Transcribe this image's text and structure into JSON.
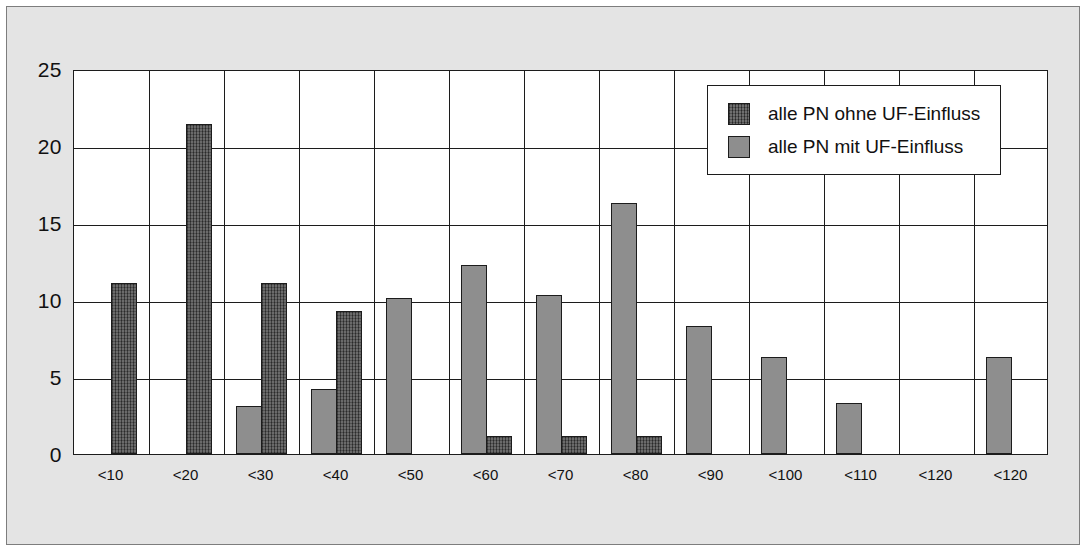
{
  "chart_data": {
    "type": "bar",
    "title": "",
    "subtitle": "",
    "xlabel": "",
    "ylabel": "",
    "ylim": [
      0,
      25
    ],
    "yticks": [
      0,
      5,
      10,
      15,
      20,
      25
    ],
    "ytick_labels": [
      "0",
      "5",
      "10",
      "15",
      "20",
      "25"
    ],
    "grid": "both",
    "legend_position": "top-right",
    "categories": [
      "<10",
      "<20",
      "<30",
      "<40",
      "<50",
      "<60",
      "<70",
      "<80",
      "<90",
      "<100",
      "<110",
      "<120",
      "<120"
    ],
    "series": [
      {
        "name": "alle PN ohne UF-Einfluss",
        "color": "#4d4d4d",
        "pattern": "cross-hatch",
        "values": [
          11.1,
          21.4,
          11.1,
          9.3,
          0,
          1.2,
          1.2,
          1.2,
          0,
          0,
          0,
          0,
          0
        ]
      },
      {
        "name": "alle PN mit UF-Einfluss",
        "color": "#8e8e8e",
        "pattern": "solid",
        "values": [
          0,
          0,
          3.1,
          4.2,
          10.1,
          12.3,
          10.3,
          16.3,
          8.3,
          6.3,
          3.3,
          0,
          6.3
        ]
      }
    ],
    "bar_layout": [
      {
        "category": "<10",
        "bars": [
          {
            "series": 0,
            "value": 11.1,
            "slot": 1
          }
        ]
      },
      {
        "category": "<20",
        "bars": [
          {
            "series": 0,
            "value": 21.4,
            "slot": 1
          }
        ]
      },
      {
        "category": "<30",
        "bars": [
          {
            "series": 1,
            "value": 3.1,
            "slot": 0
          },
          {
            "series": 0,
            "value": 11.1,
            "slot": 1
          }
        ]
      },
      {
        "category": "<40",
        "bars": [
          {
            "series": 1,
            "value": 4.2,
            "slot": 0
          },
          {
            "series": 0,
            "value": 9.3,
            "slot": 1
          }
        ]
      },
      {
        "category": "<50",
        "bars": [
          {
            "series": 1,
            "value": 10.1,
            "slot": 0
          }
        ]
      },
      {
        "category": "<60",
        "bars": [
          {
            "series": 1,
            "value": 12.3,
            "slot": 0
          },
          {
            "series": 0,
            "value": 1.2,
            "slot": 1
          }
        ]
      },
      {
        "category": "<70",
        "bars": [
          {
            "series": 1,
            "value": 10.3,
            "slot": 0
          },
          {
            "series": 0,
            "value": 1.2,
            "slot": 1
          }
        ]
      },
      {
        "category": "<80",
        "bars": [
          {
            "series": 1,
            "value": 16.3,
            "slot": 0
          },
          {
            "series": 0,
            "value": 1.2,
            "slot": 1
          }
        ]
      },
      {
        "category": "<90",
        "bars": [
          {
            "series": 1,
            "value": 8.3,
            "slot": 0
          }
        ]
      },
      {
        "category": "<100",
        "bars": [
          {
            "series": 1,
            "value": 6.3,
            "slot": 0
          }
        ]
      },
      {
        "category": "<110",
        "bars": [
          {
            "series": 1,
            "value": 3.3,
            "slot": 0
          }
        ]
      },
      {
        "category": "<120",
        "bars": []
      },
      {
        "category": "<120",
        "bars": [
          {
            "series": 1,
            "value": 6.3,
            "slot": 0
          }
        ]
      }
    ],
    "colors": {
      "plot_background": "#ffffff",
      "paper_background": "#e4e4e4",
      "axis": "#1c1c1c",
      "grid": "#1c1c1c",
      "text": "#111111"
    }
  }
}
